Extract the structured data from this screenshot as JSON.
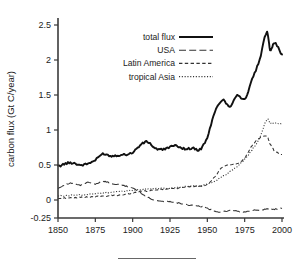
{
  "figure": {
    "caption_rule": "horizontal-rule"
  },
  "axes": {
    "ylabel": "carbon flux (Gt C/year)",
    "xlabel": "",
    "yticks": [
      "2.5",
      "2",
      "1.5",
      "1",
      "0.5",
      "0",
      "-0.25"
    ],
    "ytick_values": [
      2.5,
      2,
      1.5,
      1,
      0.5,
      0,
      -0.25
    ],
    "xticks": [
      "1850",
      "1875",
      "1900",
      "1925",
      "1950",
      "1975",
      "2000"
    ],
    "xtick_values": [
      1850,
      1875,
      1900,
      1925,
      1950,
      1975,
      2000
    ]
  },
  "legend": {
    "position": "top-left-inside",
    "entries": [
      {
        "label": "total flux",
        "style": "solid-thick"
      },
      {
        "label": "USA",
        "style": "long-dash"
      },
      {
        "label": "Latin America",
        "style": "medium-dash"
      },
      {
        "label": "tropical Asia",
        "style": "dotted"
      }
    ]
  },
  "chart_data": {
    "type": "line",
    "title": "",
    "xlabel": "",
    "ylabel": "carbon flux (Gt C/year)",
    "xlim": [
      1850,
      2000
    ],
    "ylim": [
      -0.25,
      2.5
    ],
    "grid": false,
    "legend_position": "top-left-inside",
    "x": [
      1850,
      1855,
      1860,
      1865,
      1870,
      1875,
      1880,
      1885,
      1890,
      1895,
      1900,
      1905,
      1910,
      1915,
      1920,
      1925,
      1930,
      1935,
      1940,
      1945,
      1950,
      1955,
      1960,
      1965,
      1970,
      1975,
      1980,
      1985,
      1990,
      1992,
      1995,
      2000
    ],
    "series": [
      {
        "name": "total flux",
        "style": "solid-thick",
        "values": [
          0.48,
          0.52,
          0.53,
          0.5,
          0.52,
          0.57,
          0.66,
          0.63,
          0.64,
          0.65,
          0.68,
          0.78,
          0.83,
          0.74,
          0.72,
          0.76,
          0.77,
          0.73,
          0.74,
          0.72,
          0.9,
          1.25,
          1.43,
          1.34,
          1.5,
          1.44,
          1.72,
          2.0,
          2.4,
          2.15,
          2.25,
          2.08
        ]
      },
      {
        "name": "USA",
        "style": "long-dash",
        "values": [
          0.17,
          0.22,
          0.24,
          0.21,
          0.25,
          0.23,
          0.27,
          0.24,
          0.22,
          0.2,
          0.17,
          0.11,
          0.04,
          0.0,
          -0.02,
          -0.02,
          -0.04,
          -0.06,
          -0.08,
          -0.09,
          -0.12,
          -0.16,
          -0.17,
          -0.15,
          -0.16,
          -0.17,
          -0.15,
          -0.14,
          -0.13,
          -0.13,
          -0.13,
          -0.12
        ]
      },
      {
        "name": "Latin America",
        "style": "medium-dash",
        "values": [
          0.02,
          0.03,
          0.03,
          0.04,
          0.04,
          0.05,
          0.05,
          0.06,
          0.07,
          0.08,
          0.1,
          0.12,
          0.13,
          0.14,
          0.15,
          0.16,
          0.17,
          0.18,
          0.19,
          0.2,
          0.22,
          0.33,
          0.47,
          0.5,
          0.52,
          0.6,
          0.78,
          0.88,
          0.91,
          0.8,
          0.7,
          0.65
        ]
      },
      {
        "name": "tropical Asia",
        "style": "dotted",
        "values": [
          0.06,
          0.06,
          0.07,
          0.07,
          0.08,
          0.09,
          0.1,
          0.11,
          0.12,
          0.13,
          0.14,
          0.15,
          0.16,
          0.16,
          0.17,
          0.17,
          0.18,
          0.19,
          0.2,
          0.2,
          0.23,
          0.27,
          0.33,
          0.4,
          0.48,
          0.58,
          0.72,
          0.88,
          1.15,
          1.1,
          1.1,
          1.09
        ]
      }
    ],
    "annotations": []
  }
}
